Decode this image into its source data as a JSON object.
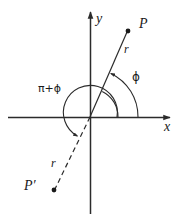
{
  "figure": {
    "type": "geometry-diagram",
    "background_color": "#ffffff",
    "stroke_color": "#2b2b2b",
    "text_color": "#1a1a1a",
    "axes": {
      "x_label": "x",
      "y_label": "y",
      "origin": {
        "x": 90,
        "y": 117
      },
      "x_axis": {
        "x1": 8,
        "y1": 117,
        "x2": 172,
        "y2": 117,
        "arrow": "right"
      },
      "y_axis": {
        "x1": 90,
        "y1": 214,
        "x2": 90,
        "y2": 10,
        "arrow": "up"
      }
    },
    "points": [
      {
        "name": "P",
        "label": "P",
        "x": 128,
        "y": 31,
        "label_x": 139,
        "label_y": 17,
        "style": "filled-dot"
      },
      {
        "name": "P-prime",
        "label": "P′",
        "x": 54,
        "y": 190,
        "label_x": 27,
        "label_y": 179,
        "style": "filled-dot"
      }
    ],
    "segments": [
      {
        "name": "radius-to-P",
        "from": "origin",
        "to": "P",
        "style": "solid",
        "length_label": "r",
        "label_x": 126,
        "label_y": 43
      },
      {
        "name": "radius-to-P-prime",
        "from": "origin",
        "to": "P-prime",
        "style": "dashed",
        "length_label": "r",
        "label_x": 53,
        "label_y": 158
      }
    ],
    "angles": [
      {
        "name": "phi",
        "label": "ϕ",
        "label_x": 134,
        "label_y": 71,
        "from_axis": "positive-x",
        "to": "radius-to-P",
        "radius": 48,
        "arrow": "counterclockwise"
      },
      {
        "name": "pi-plus-phi",
        "label": "π+ϕ",
        "label_x": 41,
        "label_y": 83,
        "from_axis": "positive-x",
        "to": "radius-to-P-prime",
        "radius": 27,
        "arrow": "counterclockwise"
      }
    ],
    "arcs_plain": [
      {
        "name": "inner-phi-arc",
        "radius": 28
      }
    ]
  }
}
